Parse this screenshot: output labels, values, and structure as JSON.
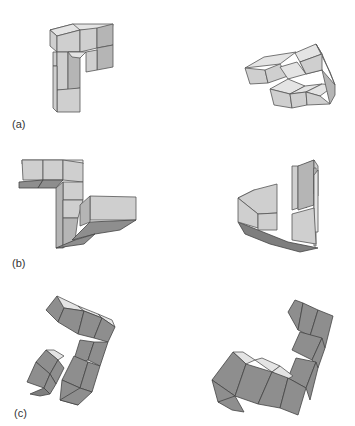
{
  "figure": {
    "rows": [
      {
        "label": "(a)",
        "description": "Pair of rotated block figures, row a"
      },
      {
        "label": "(b)",
        "description": "Pair of rotated block figures, row b"
      },
      {
        "label": "(c)",
        "description": "Pair of rotated block figures, row c"
      }
    ],
    "colors": {
      "top_face": "#e4e4e4",
      "light_face": "#cfcfcf",
      "mid_face": "#b5b5b5",
      "dark_face": "#8e8e8e",
      "edge": "#555555"
    }
  }
}
